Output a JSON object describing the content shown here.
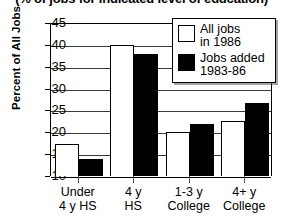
{
  "chart_data": {
    "type": "bar",
    "title": "(% of jobs for indicated level of education)",
    "xlabel": "",
    "ylabel": "Percent of All Jobs",
    "ylim": [
      10,
      45
    ],
    "ytick_step": 5,
    "yticks": [
      45,
      40,
      35,
      30,
      25,
      20,
      15,
      10
    ],
    "grid": true,
    "legend_position": "top-right",
    "categories": [
      "Under 4 y HS",
      "4 y HS",
      "1-3 y College",
      "4+ y College"
    ],
    "category_lines": [
      {
        "line1": "Under",
        "line2": "4 y HS"
      },
      {
        "line1": "4 y",
        "line2": "HS"
      },
      {
        "line1": "1-3 y",
        "line2": "College"
      },
      {
        "line1": "4+ y",
        "line2": "College"
      }
    ],
    "series": [
      {
        "name": "All jobs in 1986",
        "legend_line1": "All jobs",
        "legend_line2": "in 1986",
        "style": "white",
        "color": "#ffffff",
        "values": [
          17.3,
          40.0,
          20.0,
          22.6
        ]
      },
      {
        "name": "Jobs added 1983-86",
        "legend_line1": "Jobs added",
        "legend_line2": "1983-86",
        "style": "black",
        "color": "#000000",
        "values": [
          13.8,
          37.8,
          22.0,
          26.6
        ]
      }
    ]
  }
}
